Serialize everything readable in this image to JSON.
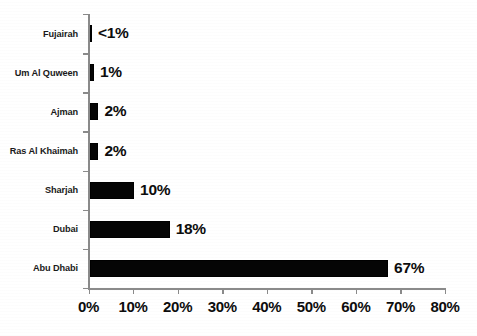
{
  "chart_data": {
    "type": "bar",
    "orientation": "horizontal",
    "title": "",
    "subtitle": "",
    "xlabel": "",
    "ylabel": "",
    "categories": [
      "Abu Dhabi",
      "Dubai",
      "Sharjah",
      "Ras Al Khaimah",
      "Ajman",
      "Um Al Quween",
      "Fujairah"
    ],
    "values": [
      67,
      18,
      10,
      2,
      2,
      1,
      0.5
    ],
    "value_labels": [
      "67%",
      "18%",
      "10%",
      "2%",
      "2%",
      "1%",
      "<1%"
    ],
    "xlim": [
      0,
      80
    ],
    "xticks": [
      0,
      10,
      20,
      30,
      40,
      50,
      60,
      70,
      80
    ],
    "xtick_labels": [
      "0%",
      "10%",
      "20%",
      "30%",
      "40%",
      "50%",
      "60%",
      "70%",
      "80%"
    ],
    "grid": false,
    "legend": false,
    "legend_position": "none",
    "bar_color": "#050505",
    "axis_color": "#8a8a8a",
    "text_color": "#0d0d0d",
    "background_color": "#ffffff"
  },
  "rows": [
    {
      "label": "Fujairah",
      "value_label": "<1%",
      "value": 0.5
    },
    {
      "label": "Um Al Quween",
      "value_label": "1%",
      "value": 1
    },
    {
      "label": "Ajman",
      "value_label": "2%",
      "value": 2
    },
    {
      "label": "Ras Al Khaimah",
      "value_label": "2%",
      "value": 2
    },
    {
      "label": "Sharjah",
      "value_label": "10%",
      "value": 10
    },
    {
      "label": "Dubai",
      "value_label": "18%",
      "value": 18
    },
    {
      "label": "Abu Dhabi",
      "value_label": "67%",
      "value": 67
    }
  ],
  "xaxis": {
    "ticks": [
      {
        "label": "0%",
        "value": 0
      },
      {
        "label": "10%",
        "value": 10
      },
      {
        "label": "20%",
        "value": 20
      },
      {
        "label": "30%",
        "value": 30
      },
      {
        "label": "40%",
        "value": 40
      },
      {
        "label": "50%",
        "value": 50
      },
      {
        "label": "60%",
        "value": 60
      },
      {
        "label": "70%",
        "value": 70
      },
      {
        "label": "80%",
        "value": 80
      }
    ]
  }
}
